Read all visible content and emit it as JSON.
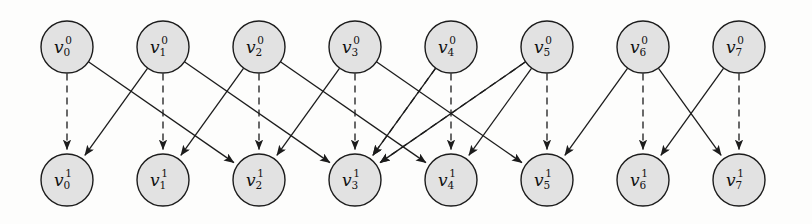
{
  "figure": {
    "type": "time-expanded-graph-diagram",
    "title": "",
    "background_color": "#fdfdfc",
    "node_fill": "#e2e2e2",
    "node_stroke": "#1c1c1c",
    "edge_color": "#1c1c1c",
    "width": 812,
    "height": 224
  },
  "layout": {
    "node_radius": 26,
    "top_row_y": 47,
    "bottom_row_y": 180,
    "column_x": [
      67,
      163,
      259,
      355,
      451,
      547,
      643,
      739
    ]
  },
  "nodes": {
    "top_row": [
      {
        "id": "v0_0",
        "base": "v",
        "sub": "0",
        "sup": "0",
        "label": "v00",
        "col": 0
      },
      {
        "id": "v1_0",
        "base": "v",
        "sub": "1",
        "sup": "0",
        "label": "v10",
        "col": 1
      },
      {
        "id": "v2_0",
        "base": "v",
        "sub": "2",
        "sup": "0",
        "label": "v20",
        "col": 2
      },
      {
        "id": "v3_0",
        "base": "v",
        "sub": "3",
        "sup": "0",
        "label": "v30",
        "col": 3
      },
      {
        "id": "v4_0",
        "base": "v",
        "sub": "4",
        "sup": "0",
        "label": "v40",
        "col": 4
      },
      {
        "id": "v5_0",
        "base": "v",
        "sub": "5",
        "sup": "0",
        "label": "v50",
        "col": 5
      },
      {
        "id": "v6_0",
        "base": "v",
        "sub": "6",
        "sup": "0",
        "label": "v60",
        "col": 6
      },
      {
        "id": "v7_0",
        "base": "v",
        "sub": "7",
        "sup": "0",
        "label": "v70",
        "col": 7
      }
    ],
    "bottom_row": [
      {
        "id": "v0_1",
        "base": "v",
        "sub": "0",
        "sup": "1",
        "label": "v01",
        "col": 0
      },
      {
        "id": "v1_1",
        "base": "v",
        "sub": "1",
        "sup": "1",
        "label": "v11",
        "col": 1
      },
      {
        "id": "v2_1",
        "base": "v",
        "sub": "2",
        "sup": "1",
        "label": "v21",
        "col": 2
      },
      {
        "id": "v3_1",
        "base": "v",
        "sub": "3",
        "sup": "1",
        "label": "v31",
        "col": 3
      },
      {
        "id": "v4_1",
        "base": "v",
        "sub": "4",
        "sup": "1",
        "label": "v41",
        "col": 4
      },
      {
        "id": "v5_1",
        "base": "v",
        "sub": "5",
        "sup": "1",
        "label": "v51",
        "col": 5
      },
      {
        "id": "v6_1",
        "base": "v",
        "sub": "6",
        "sup": "1",
        "label": "v61",
        "col": 6
      },
      {
        "id": "v7_1",
        "base": "v",
        "sub": "7",
        "sup": "1",
        "label": "v71",
        "col": 7
      }
    ]
  },
  "edges": {
    "self_loops_dashed": [
      {
        "from": 0,
        "to": 0
      },
      {
        "from": 1,
        "to": 1
      },
      {
        "from": 2,
        "to": 2
      },
      {
        "from": 3,
        "to": 3
      },
      {
        "from": 4,
        "to": 4
      },
      {
        "from": 5,
        "to": 5
      },
      {
        "from": 6,
        "to": 6
      },
      {
        "from": 7,
        "to": 7
      }
    ],
    "solid": [
      {
        "from": 0,
        "to": 2
      },
      {
        "from": 1,
        "to": 0
      },
      {
        "from": 1,
        "to": 3
      },
      {
        "from": 2,
        "to": 1
      },
      {
        "from": 2,
        "to": 4
      },
      {
        "from": 3,
        "to": 2
      },
      {
        "from": 3,
        "to": 5
      },
      {
        "from": 4,
        "to": 3
      },
      {
        "from": 5,
        "to": 4
      },
      {
        "from": 5,
        "to": 3
      },
      {
        "from": 6,
        "to": 5
      },
      {
        "from": 6,
        "to": 7
      },
      {
        "from": 7,
        "to": 6
      }
    ],
    "dashed_diagonal": [
      {
        "from": 4,
        "to": 3
      },
      {
        "from": 5,
        "to": 3
      }
    ]
  },
  "legend": {
    "dashed_meaning": "wait / hold edge",
    "solid_meaning": "transition edge"
  }
}
